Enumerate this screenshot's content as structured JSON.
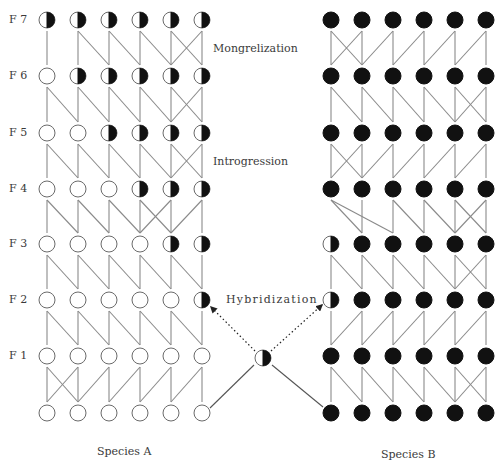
{
  "figure": {
    "generation_labels": [
      "F 7",
      "F 6",
      "F 5",
      "F 4",
      "F 3",
      "F 2",
      "F 1"
    ],
    "annotations": {
      "mongrelization": "Mongrelization",
      "introgression": "Introgression",
      "hybridization": "Hybridization"
    },
    "species": {
      "a": "Species A",
      "b": "Species B"
    },
    "colors": {
      "line": "#8a8a8a",
      "circle_stroke": "#6a6a6a",
      "fill_dark": "#111111",
      "fill_light": "#ffffff"
    },
    "legend_states": {
      "O": "pure species A (open circle)",
      "H": "hybrid (half-filled circle)",
      "B": "pure species B (filled circle)"
    },
    "left_columns_x": [
      47,
      78,
      109,
      140,
      171,
      202
    ],
    "right_columns_x": [
      331,
      362,
      393,
      424,
      455,
      486
    ],
    "rows_y": [
      20,
      76,
      133,
      189,
      244,
      300,
      356,
      413
    ],
    "row_names": [
      "F7",
      "F6",
      "F5",
      "F4",
      "F3",
      "F2",
      "F1",
      "P"
    ],
    "species_a_rows": [
      [
        "H",
        "H",
        "H",
        "H",
        "H",
        "H"
      ],
      [
        "O",
        "H",
        "H",
        "H",
        "H",
        "H"
      ],
      [
        "O",
        "O",
        "H",
        "H",
        "H",
        "H"
      ],
      [
        "O",
        "O",
        "O",
        "H",
        "H",
        "H"
      ],
      [
        "O",
        "O",
        "O",
        "O",
        "H",
        "H"
      ],
      [
        "O",
        "O",
        "O",
        "O",
        "O",
        "H"
      ],
      [
        "O",
        "O",
        "O",
        "O",
        "O",
        "O"
      ],
      [
        "O",
        "O",
        "O",
        "O",
        "O",
        "O"
      ]
    ],
    "species_b_rows": [
      [
        "B",
        "B",
        "B",
        "B",
        "B",
        "B"
      ],
      [
        "B",
        "B",
        "B",
        "B",
        "B",
        "B"
      ],
      [
        "B",
        "B",
        "B",
        "B",
        "B",
        "B"
      ],
      [
        "B",
        "B",
        "B",
        "B",
        "B",
        "B"
      ],
      [
        "H",
        "B",
        "B",
        "B",
        "B",
        "B"
      ],
      [
        "H",
        "B",
        "B",
        "B",
        "B",
        "B"
      ],
      [
        "B",
        "B",
        "B",
        "B",
        "B",
        "B"
      ],
      [
        "B",
        "B",
        "B",
        "B",
        "B",
        "B"
      ]
    ],
    "species_a_links": [
      [
        [
          0,
          0
        ],
        [
          1,
          1
        ],
        [
          1,
          2
        ],
        [
          2,
          2
        ],
        [
          2,
          3
        ],
        [
          3,
          3
        ],
        [
          3,
          4
        ],
        [
          4,
          4
        ],
        [
          4,
          5
        ],
        [
          5,
          4
        ],
        [
          5,
          5
        ]
      ],
      [
        [
          0,
          0
        ],
        [
          0,
          1
        ],
        [
          1,
          1
        ],
        [
          1,
          2
        ],
        [
          2,
          2
        ],
        [
          2,
          3
        ],
        [
          3,
          3
        ],
        [
          3,
          4
        ],
        [
          4,
          4
        ],
        [
          4,
          5
        ],
        [
          5,
          4
        ],
        [
          5,
          5
        ]
      ],
      [
        [
          0,
          0
        ],
        [
          0,
          1
        ],
        [
          1,
          1
        ],
        [
          1,
          2
        ],
        [
          2,
          2
        ],
        [
          2,
          3
        ],
        [
          3,
          3
        ],
        [
          3,
          4
        ],
        [
          4,
          4
        ],
        [
          4,
          5
        ],
        [
          5,
          4
        ],
        [
          5,
          5
        ]
      ],
      [
        [
          0,
          0
        ],
        [
          0,
          1
        ],
        [
          1,
          1
        ],
        [
          1,
          2
        ],
        [
          2,
          2
        ],
        [
          2,
          3
        ],
        [
          3,
          3
        ],
        [
          3,
          4
        ],
        [
          4,
          3
        ],
        [
          4,
          4
        ],
        [
          5,
          4
        ],
        [
          5,
          5
        ]
      ],
      [
        [
          0,
          0
        ],
        [
          0,
          1
        ],
        [
          1,
          1
        ],
        [
          1,
          2
        ],
        [
          2,
          2
        ],
        [
          2,
          3
        ],
        [
          3,
          3
        ],
        [
          3,
          4
        ],
        [
          4,
          4
        ],
        [
          4,
          5
        ],
        [
          5,
          5
        ]
      ],
      [
        [
          0,
          0
        ],
        [
          0,
          1
        ],
        [
          1,
          1
        ],
        [
          1,
          2
        ],
        [
          2,
          2
        ],
        [
          2,
          3
        ],
        [
          3,
          3
        ],
        [
          3,
          4
        ],
        [
          4,
          4
        ],
        [
          4,
          5
        ],
        [
          5,
          5
        ]
      ],
      [
        [
          0,
          0
        ],
        [
          0,
          1
        ],
        [
          1,
          0
        ],
        [
          1,
          1
        ],
        [
          2,
          1
        ],
        [
          2,
          2
        ],
        [
          3,
          2
        ],
        [
          3,
          3
        ],
        [
          4,
          3
        ],
        [
          4,
          4
        ],
        [
          5,
          4
        ],
        [
          5,
          5
        ]
      ]
    ],
    "species_b_links": [
      [
        [
          0,
          0
        ],
        [
          0,
          1
        ],
        [
          1,
          0
        ],
        [
          1,
          1
        ],
        [
          2,
          1
        ],
        [
          2,
          2
        ],
        [
          3,
          2
        ],
        [
          3,
          3
        ],
        [
          4,
          3
        ],
        [
          4,
          4
        ],
        [
          5,
          4
        ],
        [
          5,
          5
        ]
      ],
      [
        [
          0,
          0
        ],
        [
          0,
          1
        ],
        [
          1,
          1
        ],
        [
          1,
          2
        ],
        [
          2,
          2
        ],
        [
          2,
          3
        ],
        [
          3,
          3
        ],
        [
          3,
          4
        ],
        [
          4,
          4
        ],
        [
          4,
          5
        ],
        [
          5,
          4
        ],
        [
          5,
          5
        ]
      ],
      [
        [
          0,
          0
        ],
        [
          0,
          1
        ],
        [
          1,
          0
        ],
        [
          1,
          1
        ],
        [
          2,
          1
        ],
        [
          2,
          2
        ],
        [
          3,
          2
        ],
        [
          3,
          3
        ],
        [
          4,
          3
        ],
        [
          4,
          4
        ],
        [
          5,
          4
        ],
        [
          5,
          5
        ]
      ],
      [
        [
          0,
          1
        ],
        [
          0,
          2
        ],
        [
          1,
          1
        ],
        [
          2,
          2
        ],
        [
          2,
          3
        ],
        [
          3,
          3
        ],
        [
          3,
          4
        ],
        [
          4,
          4
        ],
        [
          4,
          5
        ],
        [
          5,
          4
        ],
        [
          5,
          5
        ]
      ],
      [
        [
          0,
          0
        ],
        [
          0,
          1
        ],
        [
          1,
          1
        ],
        [
          1,
          2
        ],
        [
          2,
          2
        ],
        [
          2,
          3
        ],
        [
          3,
          3
        ],
        [
          3,
          4
        ],
        [
          4,
          4
        ],
        [
          4,
          5
        ],
        [
          5,
          4
        ],
        [
          5,
          5
        ]
      ],
      [
        [
          0,
          0
        ],
        [
          1,
          0
        ],
        [
          1,
          1
        ],
        [
          2,
          1
        ],
        [
          2,
          2
        ],
        [
          3,
          2
        ],
        [
          3,
          3
        ],
        [
          4,
          3
        ],
        [
          4,
          4
        ],
        [
          5,
          4
        ],
        [
          5,
          5
        ]
      ],
      [
        [
          0,
          0
        ],
        [
          0,
          1
        ],
        [
          1,
          1
        ],
        [
          1,
          2
        ],
        [
          2,
          2
        ],
        [
          2,
          3
        ],
        [
          3,
          3
        ],
        [
          3,
          4
        ],
        [
          4,
          4
        ],
        [
          4,
          5
        ],
        [
          5,
          4
        ],
        [
          5,
          5
        ]
      ]
    ],
    "hybrid_node": {
      "x": 263,
      "y": 358,
      "state": "H"
    },
    "hybrid_solid_links": [
      {
        "from": "left-parent-6",
        "to": "hybrid"
      },
      {
        "from": "hybrid",
        "to": "right-parent-1"
      }
    ],
    "hybrid_dotted_arrows": [
      {
        "from": "hybrid",
        "to": "left-F2-6"
      },
      {
        "from": "hybrid",
        "to": "right-F2-1"
      }
    ]
  }
}
